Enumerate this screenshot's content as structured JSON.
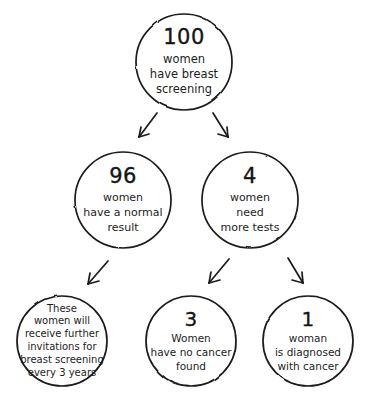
{
  "diagram": {
    "type": "flowchart",
    "style": "hand-drawn",
    "colors": {
      "background": "#ffffff",
      "stroke": "#1b1b1b",
      "text": "#1b1b1b"
    },
    "nodes": [
      {
        "id": "top",
        "number": "100",
        "lines": [
          "women",
          "have breast",
          "screening"
        ],
        "cx": 184,
        "cy": 62,
        "r": 48
      },
      {
        "id": "normal",
        "number": "96",
        "lines": [
          "women",
          "have a normal",
          "result"
        ],
        "cx": 123,
        "cy": 200,
        "r": 48
      },
      {
        "id": "moretests",
        "number": "4",
        "lines": [
          "women",
          "need",
          "more tests"
        ],
        "cx": 250,
        "cy": 200,
        "r": 48
      },
      {
        "id": "invitations",
        "number": "",
        "lines": [
          "These",
          "women will",
          "receive further",
          "invitations for",
          "breast screening",
          "every 3 years"
        ],
        "cx": 62,
        "cy": 341,
        "r": 45
      },
      {
        "id": "nocancer",
        "number": "3",
        "lines": [
          "Women",
          "have no cancer",
          "found"
        ],
        "cx": 191,
        "cy": 341,
        "r": 45
      },
      {
        "id": "diagnosed",
        "number": "1",
        "lines": [
          "woman",
          "is diagnosed",
          "with cancer"
        ],
        "cx": 308,
        "cy": 341,
        "r": 45
      }
    ],
    "arrows": [
      {
        "id": "top-to-normal",
        "from": "top",
        "to": "normal",
        "direction": "down-left"
      },
      {
        "id": "top-to-moretests",
        "from": "top",
        "to": "moretests",
        "direction": "down-right"
      },
      {
        "id": "normal-to-invitations",
        "from": "normal",
        "to": "invitations",
        "direction": "down-left"
      },
      {
        "id": "moretests-to-nocancer",
        "from": "moretests",
        "to": "nocancer",
        "direction": "down-left"
      },
      {
        "id": "moretests-to-diagnosed",
        "from": "moretests",
        "to": "diagnosed",
        "direction": "down-right"
      }
    ]
  }
}
